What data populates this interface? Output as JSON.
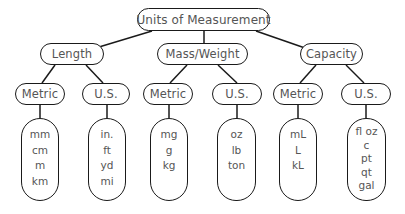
{
  "root": {
    "label": "Units of Measurement"
  },
  "categories": [
    {
      "label": "Length",
      "systems": [
        {
          "label": "Metric",
          "units": [
            "mm",
            "cm",
            "m",
            "km"
          ]
        },
        {
          "label": "U.S.",
          "units": [
            "in.",
            "ft",
            "yd",
            "mi"
          ]
        }
      ]
    },
    {
      "label": "Mass/Weight",
      "systems": [
        {
          "label": "Metric",
          "units": [
            "mg",
            "g",
            "kg"
          ]
        },
        {
          "label": "U.S.",
          "units": [
            "oz",
            "lb",
            "ton"
          ]
        }
      ]
    },
    {
      "label": "Capacity",
      "systems": [
        {
          "label": "Metric",
          "units": [
            "mL",
            "L",
            "kL"
          ]
        },
        {
          "label": "U.S.",
          "units": [
            "fl oz",
            "c",
            "pt",
            "qt",
            "gal"
          ]
        }
      ]
    }
  ]
}
